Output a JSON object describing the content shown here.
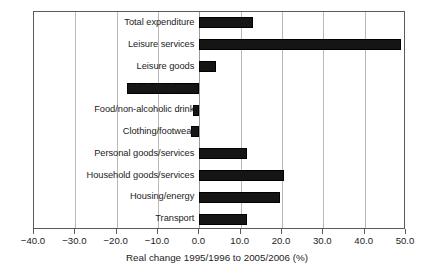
{
  "chart_data": {
    "type": "bar",
    "orientation": "horizontal",
    "title": "",
    "xlabel": "Real change 1995/1996 to 2005/2006 (%)",
    "ylabel": "",
    "xlim": [
      -40.0,
      50.0
    ],
    "xticks": [
      "-40.0",
      "-30.0",
      "-20.0",
      "-10.0",
      "0.0",
      "10.0",
      "20.0",
      "30.0",
      "40.0",
      "50.0"
    ],
    "xtick_values": [
      -40,
      -30,
      -20,
      -10,
      0,
      10,
      20,
      30,
      40,
      50
    ],
    "grid": "vertical",
    "legend": "none",
    "bar_color": "#151515",
    "categories": [
      "Total expenditure",
      "Leisure services",
      "Leisure goods",
      "Alcohol/tobacco",
      "Food/non-alcoholic drink",
      "Clothing/footwear",
      "Personal goods/services",
      "Household goods/services",
      "Housing/energy",
      "Transport"
    ],
    "values": [
      13.1,
      48.8,
      4.1,
      -17.4,
      -1.6,
      -2.0,
      11.5,
      20.5,
      19.5,
      11.6
    ]
  }
}
